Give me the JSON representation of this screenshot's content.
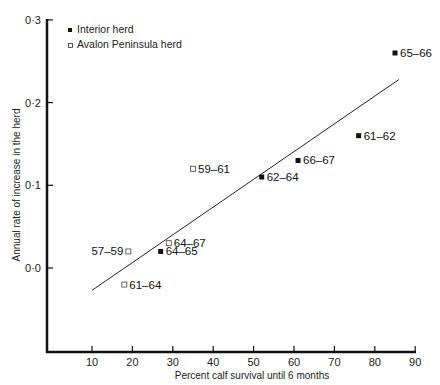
{
  "chart_data": {
    "type": "scatter",
    "title": "",
    "xlabel": "Percent calf survival until 6 months",
    "ylabel": "Annual rate of increase in the herd",
    "xlim": [
      0,
      90
    ],
    "ylim": [
      -0.1,
      0.3
    ],
    "x_ticks": [
      "10",
      "20",
      "30",
      "40",
      "50",
      "60",
      "70",
      "80",
      "90"
    ],
    "y_ticks": [
      "0·0",
      "0·1",
      "0·2",
      "0·3"
    ],
    "grid": false,
    "legend_position": "top-left",
    "legend": [
      {
        "label": "Interior herd",
        "marker": "filled-square"
      },
      {
        "label": "Avalon Peninsula herd",
        "marker": "open-square"
      }
    ],
    "series": [
      {
        "name": "Interior herd",
        "marker": "filled-square",
        "points": [
          {
            "label": "65-66",
            "x": 85,
            "y": 0.26
          },
          {
            "label": "61-62",
            "x": 76,
            "y": 0.16
          },
          {
            "label": "66-67",
            "x": 61,
            "y": 0.13
          },
          {
            "label": "62-64",
            "x": 52,
            "y": 0.11
          },
          {
            "label": "64-65",
            "x": 27,
            "y": 0.02
          }
        ]
      },
      {
        "name": "Avalon Peninsula herd",
        "marker": "open-square",
        "points": [
          {
            "label": "59-61",
            "x": 35,
            "y": 0.12
          },
          {
            "label": "64-67",
            "x": 29,
            "y": 0.03
          },
          {
            "label": "57-59",
            "x": 19,
            "y": 0.02
          },
          {
            "label": "61-64",
            "x": 18,
            "y": -0.02
          }
        ]
      }
    ],
    "regression_line": {
      "x_start": 10,
      "y_start": -0.027,
      "x_end": 86,
      "y_end": 0.228
    }
  }
}
